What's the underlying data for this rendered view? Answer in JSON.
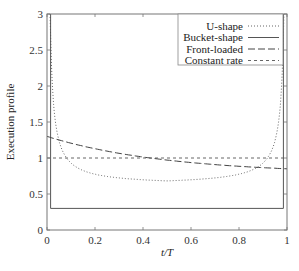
{
  "chart_data": {
    "type": "line",
    "title": "",
    "xlabel": "t/T",
    "ylabel": "Execution profile",
    "xlim": [
      0,
      1
    ],
    "ylim": [
      0,
      3
    ],
    "xticks": [
      0,
      0.2,
      0.4,
      0.6,
      0.8,
      1
    ],
    "xtick_labels": [
      "0",
      "0.2",
      "0.4",
      "0.6",
      "0.8",
      "1"
    ],
    "yticks": [
      0,
      0.5,
      1,
      1.5,
      2,
      2.5,
      3
    ],
    "ytick_labels": [
      "0",
      "0.5",
      "1",
      "1.5",
      "2",
      "2.5",
      "3"
    ],
    "grid": false,
    "legend_position": "upper right",
    "series": [
      {
        "name": "U-shape",
        "style": "dotted",
        "x": [
          0.01,
          0.02,
          0.03,
          0.05,
          0.08,
          0.1,
          0.15,
          0.2,
          0.3,
          0.4,
          0.5,
          0.6,
          0.7,
          0.8,
          0.85,
          0.9,
          0.92,
          0.95,
          0.97,
          0.98,
          0.99
        ],
        "values": [
          3.0,
          2.2,
          1.75,
          1.3,
          1.05,
          0.97,
          0.84,
          0.77,
          0.69,
          0.66,
          0.65,
          0.66,
          0.69,
          0.77,
          0.84,
          0.97,
          1.05,
          1.3,
          1.75,
          2.2,
          3.0
        ]
      },
      {
        "name": "Bucket-shape",
        "style": "solid",
        "x": [
          0.015,
          0.015,
          0.985,
          0.985
        ],
        "values": [
          3.0,
          0.3,
          0.3,
          3.0
        ]
      },
      {
        "name": "Front-loaded",
        "style": "dashed",
        "x": [
          0,
          0.1,
          0.2,
          0.3,
          0.4,
          0.5,
          0.6,
          0.7,
          0.8,
          0.9,
          1.0
        ],
        "values": [
          1.3,
          1.23,
          1.16,
          1.1,
          1.05,
          1.0,
          0.96,
          0.93,
          0.9,
          0.87,
          0.85
        ]
      },
      {
        "name": "Constant rate",
        "style": "short-dashed",
        "x": [
          0,
          1
        ],
        "values": [
          1.0,
          1.0
        ]
      }
    ]
  }
}
